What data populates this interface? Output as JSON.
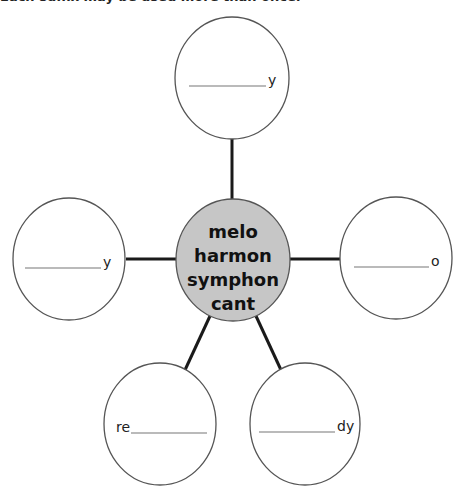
{
  "instructions": "Each suffix may be used more than once.",
  "center": {
    "words": [
      "melo",
      "harmon",
      "symphon",
      "cant"
    ],
    "fill": "#c6c6c6"
  },
  "bubbles": [
    {
      "id": "top",
      "prefix": "",
      "suffix": "y"
    },
    {
      "id": "left",
      "prefix": "",
      "suffix": "y"
    },
    {
      "id": "right",
      "prefix": "",
      "suffix": "o"
    },
    {
      "id": "bottom-left",
      "prefix": "re",
      "suffix": ""
    },
    {
      "id": "bottom-right",
      "prefix": "",
      "suffix": "dy"
    }
  ],
  "colors": {
    "stroke": "#555555",
    "connector": "#1a1a1a",
    "blank_line": "#777777"
  }
}
